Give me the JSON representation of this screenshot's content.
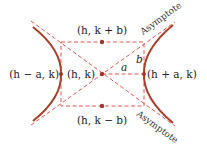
{
  "diagram": {
    "colors": {
      "curve": "#a8402a",
      "guide": "#d9463a",
      "point": "#b0302a",
      "text": "#222222"
    },
    "labels": {
      "center": "(h, k)",
      "top": "(h, k + b)",
      "bottom": "(h, k − b)",
      "left_vertex": "(h − a, k)",
      "right_vertex": "(h + a, k)",
      "a": "a",
      "b": "b",
      "asymptote_top": "Asymptote",
      "asymptote_bottom": "Asymptote"
    },
    "points": [
      {
        "name": "center",
        "x": 102,
        "y": 74
      },
      {
        "name": "top",
        "x": 102,
        "y": 42
      },
      {
        "name": "bottom",
        "x": 102,
        "y": 106
      },
      {
        "name": "left-vertex",
        "x": 61,
        "y": 74
      },
      {
        "name": "right-vertex",
        "x": 144,
        "y": 74
      }
    ]
  }
}
